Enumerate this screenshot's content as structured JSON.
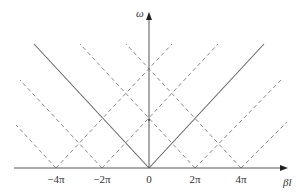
{
  "diagram": {
    "axes": {
      "x_label": "βl",
      "y_label": "ω",
      "x_ticks": [
        {
          "value": -4,
          "label": "−4π"
        },
        {
          "value": -2,
          "label": "−2π"
        },
        {
          "value": 0,
          "label": "0"
        },
        {
          "value": 2,
          "label": "2π"
        },
        {
          "value": 4,
          "label": "4π"
        }
      ]
    },
    "solid_lines": [
      {
        "name": "fundamental-backward",
        "from_pi": 0,
        "direction": "left"
      },
      {
        "name": "fundamental-forward",
        "from_pi": 0,
        "direction": "right"
      }
    ],
    "dashed_lines": [
      {
        "from_pi": -4,
        "direction": "left"
      },
      {
        "from_pi": -4,
        "direction": "right"
      },
      {
        "from_pi": -2,
        "direction": "left"
      },
      {
        "from_pi": -2,
        "direction": "right"
      },
      {
        "from_pi": 2,
        "direction": "left"
      },
      {
        "from_pi": 2,
        "direction": "right"
      },
      {
        "from_pi": 4,
        "direction": "left"
      },
      {
        "from_pi": 4,
        "direction": "right"
      }
    ],
    "colors": {
      "axis": "#555555",
      "solid": "#666666",
      "dashed": "#888888"
    }
  }
}
